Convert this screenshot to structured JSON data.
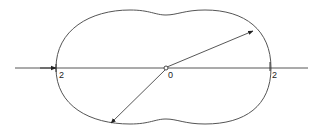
{
  "diagram": {
    "type": "polar-curve",
    "colors": {
      "curve": "#555555",
      "axis": "#444444",
      "arrow": "#333333",
      "background": "#ffffff"
    },
    "axis": {
      "labels": {
        "left": "2",
        "center": "0",
        "right": "2"
      }
    },
    "arrows": [
      {
        "name": "radius-upper-right",
        "from": "0",
        "direction": "upper-right"
      },
      {
        "name": "radius-lower-left",
        "from": "0",
        "direction": "lower-left"
      },
      {
        "name": "axis-incoming",
        "direction": "right"
      }
    ]
  }
}
